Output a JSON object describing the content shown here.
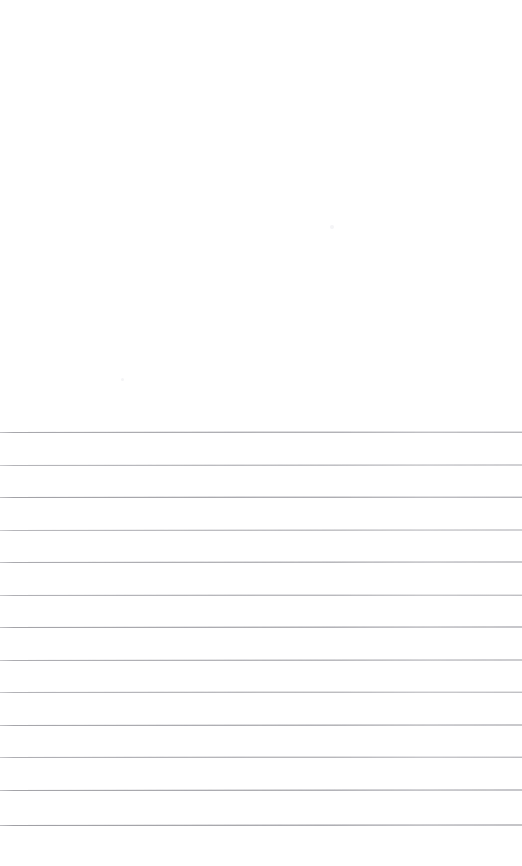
{
  "document": {
    "kind": "scanned-ruled-page",
    "title": "Blank Lined Notebook Page",
    "page_width": 522,
    "page_height": 866,
    "paper_color": "#ffffff",
    "rule_color": "#b4b4b8",
    "text_content": "",
    "handwriting_present": "none",
    "blank_region": {
      "label": "Blank upper area",
      "top": 0,
      "height": 430
    },
    "ruled_region": {
      "label": "Ruled writing area",
      "first_line_y": 432,
      "line_spacing": 32.5,
      "line_count": 13,
      "line_thickness": 1,
      "left_margin": 0,
      "right_margin": 522
    },
    "rules": [
      {
        "index": 1,
        "y": 432,
        "skew": -0.04,
        "opacity": 0.85
      },
      {
        "index": 2,
        "y": 465,
        "skew": -0.05,
        "opacity": 0.72
      },
      {
        "index": 3,
        "y": 497,
        "skew": -0.04,
        "opacity": 0.9
      },
      {
        "index": 4,
        "y": 530,
        "skew": -0.06,
        "opacity": 0.7
      },
      {
        "index": 5,
        "y": 562,
        "skew": -0.05,
        "opacity": 0.82
      },
      {
        "index": 6,
        "y": 595,
        "skew": -0.04,
        "opacity": 0.76
      },
      {
        "index": 7,
        "y": 627,
        "skew": -0.05,
        "opacity": 0.88
      },
      {
        "index": 8,
        "y": 660,
        "skew": -0.05,
        "opacity": 0.8
      },
      {
        "index": 9,
        "y": 692,
        "skew": -0.04,
        "opacity": 0.74
      },
      {
        "index": 10,
        "y": 725,
        "skew": -0.06,
        "opacity": 0.86
      },
      {
        "index": 11,
        "y": 757,
        "skew": -0.04,
        "opacity": 0.78
      },
      {
        "index": 12,
        "y": 790,
        "skew": -0.05,
        "opacity": 0.88
      },
      {
        "index": 13,
        "y": 825,
        "skew": -0.06,
        "opacity": 0.92
      }
    ],
    "specks": [
      {
        "label": "scan-artifact-upper",
        "x": 330,
        "y": 225,
        "size": 4
      },
      {
        "label": "scan-artifact-lower",
        "x": 121,
        "y": 378,
        "size": 3
      }
    ]
  }
}
